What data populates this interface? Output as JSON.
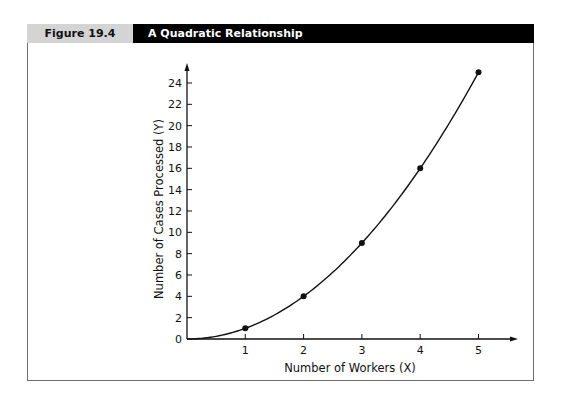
{
  "figure": {
    "label": "Figure 19.4",
    "title": "A Quadratic Relationship"
  },
  "chart_data": {
    "type": "line",
    "title": "A Quadratic Relationship",
    "xlabel": "Number of Workers (X)",
    "ylabel": "Number of Cases Processed (Y)",
    "x": [
      1,
      2,
      3,
      4,
      5
    ],
    "series": [
      {
        "name": "Cases Processed",
        "values": [
          1,
          4,
          9,
          16,
          25
        ]
      }
    ],
    "curve": "Y = X^2 (smooth curve from origin)",
    "x_ticks": [
      1,
      2,
      3,
      4,
      5
    ],
    "y_ticks": [
      0,
      2,
      4,
      6,
      8,
      10,
      12,
      14,
      16,
      18,
      20,
      22,
      24
    ],
    "xlim": [
      0,
      5.6
    ],
    "ylim": [
      0,
      25
    ],
    "grid": false,
    "legend": "none",
    "markers": true
  }
}
